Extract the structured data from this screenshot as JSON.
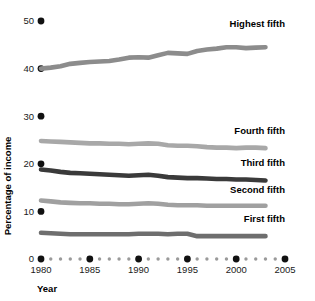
{
  "chart_data": {
    "type": "line",
    "title": "",
    "xlabel": "Year",
    "ylabel": "Percentage of income",
    "xlim": [
      1980,
      2005
    ],
    "ylim": [
      0,
      52
    ],
    "grid": false,
    "legend_position": "inline-right",
    "x": [
      1980,
      1981,
      1982,
      1983,
      1984,
      1985,
      1986,
      1987,
      1988,
      1989,
      1990,
      1991,
      1992,
      1993,
      1994,
      1995,
      1996,
      1997,
      1998,
      1999,
      2000,
      2001,
      2002,
      2003
    ],
    "y_ticks": [
      0,
      10,
      20,
      30,
      40,
      50
    ],
    "y_tick_labels": [
      "0",
      "10",
      "20",
      "30",
      "40",
      "50"
    ],
    "x_ticks": [
      1980,
      1985,
      1990,
      1995,
      2000,
      2005
    ],
    "x_tick_labels": [
      "1980",
      "1985",
      "1990",
      "1995",
      "2000",
      "2005"
    ],
    "series": [
      {
        "name": "Highest fifth",
        "color": "#8c8c8c",
        "values": [
          40.0,
          40.2,
          40.5,
          41.0,
          41.2,
          41.4,
          41.5,
          41.6,
          41.9,
          42.3,
          42.4,
          42.3,
          42.8,
          43.3,
          43.2,
          43.1,
          43.7,
          44.0,
          44.2,
          44.5,
          44.5,
          44.3,
          44.4,
          44.5
        ],
        "label_text": "Highest fifth"
      },
      {
        "name": "Fourth fifth",
        "color": "#a8a8a8",
        "values": [
          24.8,
          24.7,
          24.6,
          24.5,
          24.4,
          24.3,
          24.3,
          24.2,
          24.2,
          24.1,
          24.2,
          24.3,
          24.2,
          23.9,
          23.8,
          23.8,
          23.7,
          23.5,
          23.4,
          23.4,
          23.3,
          23.4,
          23.4,
          23.3
        ],
        "label_text": "Fourth fifth"
      },
      {
        "name": "Third fifth",
        "color": "#3a3a3a",
        "values": [
          18.8,
          18.6,
          18.3,
          18.1,
          18.0,
          17.9,
          17.8,
          17.7,
          17.6,
          17.5,
          17.6,
          17.7,
          17.5,
          17.2,
          17.1,
          17.0,
          17.0,
          16.9,
          16.8,
          16.8,
          16.7,
          16.7,
          16.6,
          16.5
        ],
        "label_text": "Third fifth"
      },
      {
        "name": "Second fifth",
        "color": "#a0a0a0",
        "values": [
          12.3,
          12.1,
          11.9,
          11.8,
          11.7,
          11.7,
          11.6,
          11.6,
          11.5,
          11.5,
          11.6,
          11.7,
          11.6,
          11.4,
          11.3,
          11.3,
          11.3,
          11.2,
          11.2,
          11.2,
          11.2,
          11.2,
          11.2,
          11.2
        ],
        "label_text": "Second fifth"
      },
      {
        "name": "First fifth",
        "color": "#6e6e6e",
        "values": [
          5.5,
          5.4,
          5.3,
          5.2,
          5.2,
          5.2,
          5.2,
          5.2,
          5.2,
          5.2,
          5.3,
          5.3,
          5.3,
          5.2,
          5.3,
          5.3,
          4.8,
          4.8,
          4.8,
          4.8,
          4.8,
          4.8,
          4.8,
          4.8
        ],
        "label_text": "First fifth"
      }
    ],
    "axis_dots": {
      "major_color": "#111111",
      "minor_color": "#9a9a9a",
      "major_years": [
        1980,
        1985,
        1990,
        1995,
        2000,
        2005
      ],
      "minor_years": [
        1981,
        1982,
        1983,
        1984,
        1986,
        1987,
        1988,
        1989,
        1991,
        1992,
        1993,
        1994,
        1996,
        1997,
        1998,
        1999,
        2001,
        2002,
        2003,
        2004
      ]
    },
    "ytick_marker_color": "#111111"
  },
  "labels": {
    "y_axis_title": "Percentage of income",
    "x_axis_title": "Year"
  }
}
